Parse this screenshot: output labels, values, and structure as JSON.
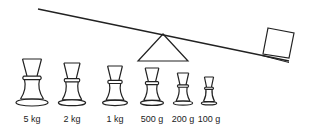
{
  "diagram": {
    "colors": {
      "line": "#222222",
      "background": "#ffffff"
    },
    "beam": {
      "x1": 38,
      "y1": 9,
      "x2": 289,
      "y2": 61
    },
    "fulcrum": {
      "apex_x": 163,
      "apex_y": 34,
      "base_left": 138,
      "base_right": 188,
      "base_y": 61
    },
    "box": {
      "label": "box-on-beam"
    },
    "weights": [
      {
        "label": "5 kg",
        "cx": 32,
        "top": 59,
        "scale": 1.0
      },
      {
        "label": "2 kg",
        "cx": 72,
        "top": 63,
        "scale": 0.85
      },
      {
        "label": "1 kg",
        "cx": 115,
        "top": 66,
        "scale": 0.78
      },
      {
        "label": "500 g",
        "cx": 152,
        "top": 68,
        "scale": 0.72
      },
      {
        "label": "200 g",
        "cx": 183,
        "top": 73,
        "scale": 0.6
      },
      {
        "label": "100 g",
        "cx": 209,
        "top": 77,
        "scale": 0.48
      }
    ]
  }
}
